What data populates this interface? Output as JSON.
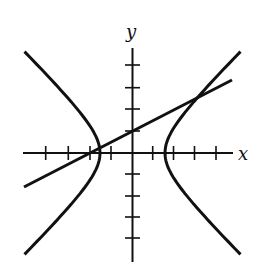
{
  "figure": {
    "type": "graph",
    "x_label": "x",
    "y_label": "y",
    "x_ticks": [
      -4,
      -3,
      -2,
      -1,
      1,
      2,
      3,
      4
    ],
    "y_ticks": [
      -4,
      -3,
      -2,
      -1,
      1,
      2,
      3,
      4
    ],
    "curves": [
      {
        "name": "hyperbola",
        "description": "Horizontal hyperbola centered at origin with vertices at approximately (±1.5, 0)"
      },
      {
        "name": "line",
        "description": "Line y = x/2 + 1 intersecting both branches of the hyperbola"
      }
    ],
    "colors": {
      "stroke": "#111111",
      "background": "#ffffff"
    }
  }
}
